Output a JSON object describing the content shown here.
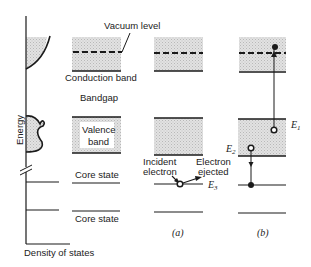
{
  "axis": {
    "ylabel": "Energy",
    "xlabel": "Density of states"
  },
  "labels": {
    "vacuum_level": "Vacuum level",
    "conduction_band": "Conduction band",
    "bandgap": "Bandgap",
    "valence_band_line1": "Valence",
    "valence_band_line2": "band",
    "core_state_1": "Core state",
    "core_state_2": "Core state",
    "incident_line1": "Incident",
    "incident_line2": "electron",
    "ejected_line1": "Electron",
    "ejected_line2": "ejected"
  },
  "energies": {
    "e1": "E",
    "e1_sub": "1",
    "e2": "E",
    "e2_sub": "2",
    "e3": "E",
    "e3_sub": "3"
  },
  "panels": {
    "a": "(a)",
    "b": "(b)"
  },
  "colors": {
    "band_fill": "#d9d9d9",
    "line": "#1a1a1a"
  }
}
